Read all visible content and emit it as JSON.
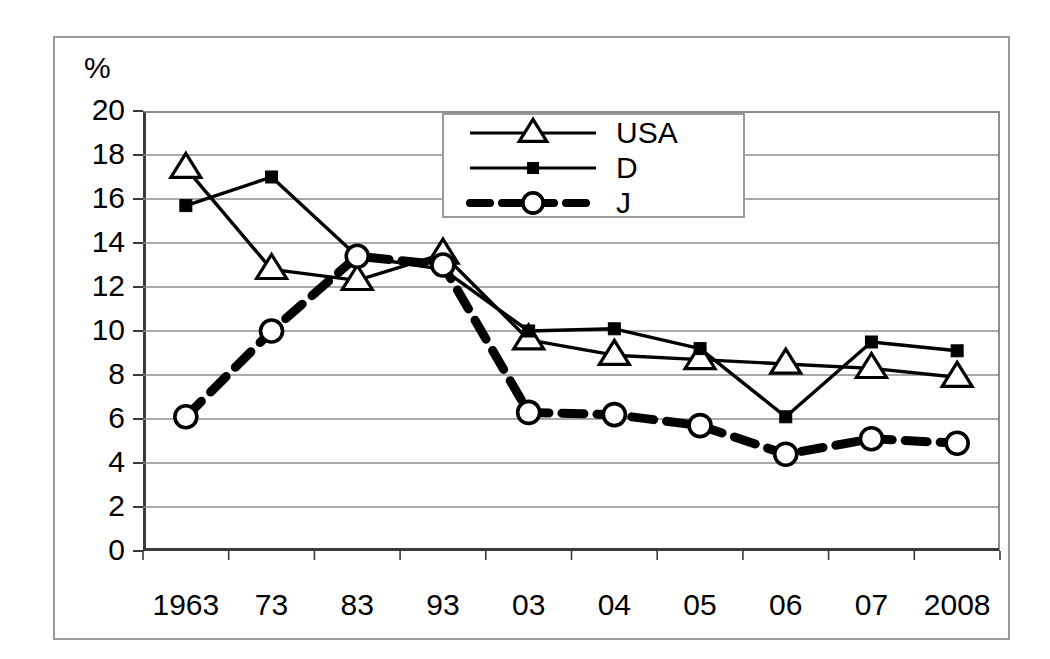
{
  "chart_data": {
    "type": "line",
    "title": "",
    "xlabel": "",
    "ylabel": "%",
    "ylim": [
      0,
      20
    ],
    "ytick_step": 2,
    "grid": true,
    "legend_position": "top-center",
    "categories": [
      "1963",
      "73",
      "83",
      "93",
      "03",
      "04",
      "05",
      "06",
      "07",
      "2008"
    ],
    "ytick_labels": [
      "20",
      "18",
      "16",
      "14",
      "12",
      "10",
      "8",
      "6",
      "4",
      "2",
      "0"
    ],
    "series": [
      {
        "name": "USA",
        "marker": "open-triangle",
        "line": "solid",
        "values": [
          17.4,
          12.8,
          12.3,
          13.5,
          9.6,
          8.9,
          8.7,
          8.5,
          8.3,
          7.9
        ]
      },
      {
        "name": "D",
        "marker": "filled-square",
        "line": "solid",
        "values": [
          15.7,
          17.0,
          13.4,
          12.8,
          10.0,
          10.1,
          9.2,
          6.1,
          9.5,
          9.1
        ]
      },
      {
        "name": "J",
        "marker": "open-circle",
        "line": "thick-dashed",
        "values": [
          6.1,
          10.0,
          13.4,
          13.0,
          6.3,
          6.2,
          5.7,
          4.4,
          5.1,
          4.9
        ]
      }
    ]
  },
  "legend": {
    "entries": [
      {
        "label": "USA"
      },
      {
        "label": "D"
      },
      {
        "label": "J"
      }
    ]
  },
  "axis": {
    "unit_label": "%"
  },
  "colors": {
    "series_line": "#000000",
    "grid": "#8d8d8d",
    "axis": "#3a3a3a",
    "frame": "#9a9a9a",
    "background": "#ffffff"
  }
}
